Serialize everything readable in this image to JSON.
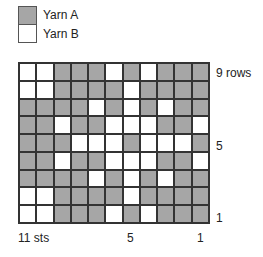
{
  "legend": {
    "items": [
      {
        "label": "Yarn A",
        "color": "#a6a6a6"
      },
      {
        "label": "Yarn B",
        "color": "#ffffff"
      }
    ]
  },
  "chart": {
    "rows_label": "9 rows",
    "row_marker_5": "5",
    "row_marker_1": "1",
    "sts_label": "11 sts",
    "st_marker_5": "5",
    "st_marker_1": "1",
    "colors": {
      "A": "#a6a6a6",
      "B": "#ffffff"
    },
    "rows_top_to_bottom": [
      "BBAAABABAAA",
      "BBAAAABAAAA",
      "AAAABABABAA",
      "AABAABBBAAB",
      "AAABBBABBBA",
      "AABAABBBAAB",
      "AAAABABABAA",
      "BBAAAABAAAA",
      "BBAAABABAAA"
    ]
  }
}
